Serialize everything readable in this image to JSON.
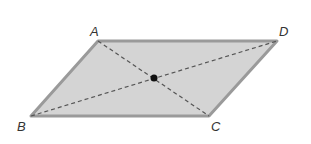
{
  "figure": {
    "type": "parallelogram",
    "vertices": [
      {
        "label": "A",
        "x": 98,
        "y": 41,
        "lx": 90,
        "ly": 36
      },
      {
        "label": "D",
        "x": 277,
        "y": 41,
        "lx": 279,
        "ly": 36
      },
      {
        "label": "C",
        "x": 209,
        "y": 116,
        "lx": 211,
        "ly": 131
      },
      {
        "label": "B",
        "x": 31,
        "y": 116,
        "lx": 17,
        "ly": 131
      }
    ],
    "diagonals": [
      "AC",
      "BD"
    ],
    "intersection_point": {
      "x": 154,
      "y": 78
    },
    "colors": {
      "fill": "#d4d4d4",
      "edge": "#9a9a9a",
      "diagonal": "#555555",
      "point": "#111111"
    }
  }
}
